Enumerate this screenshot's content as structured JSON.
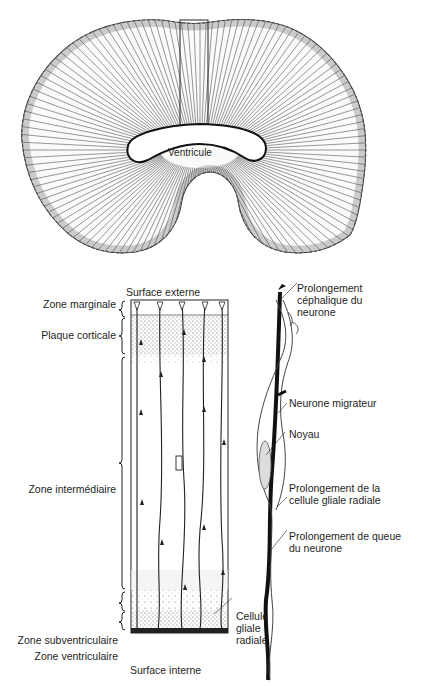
{
  "figure": {
    "top_panel": {
      "name": "coronal-section-brain",
      "labels": {
        "ventricle": "Ventricule"
      }
    },
    "left_panel": {
      "name": "cortical-column",
      "surface_top": "Surface externe",
      "surface_bottom": "Surface interne",
      "zones": [
        {
          "id": "marginal",
          "label": "Zone marginale"
        },
        {
          "id": "cortical_plate",
          "label": "Plaque corticale"
        },
        {
          "id": "intermediate",
          "label": "Zone intermédiaire"
        },
        {
          "id": "subventricular",
          "label": "Zone subventriculaire"
        },
        {
          "id": "ventricular",
          "label": "Zone ventriculaire"
        }
      ],
      "radial_glia_label": "Cellule gliale radiale"
    },
    "right_panel": {
      "name": "migrating-neuron-detail",
      "labels": [
        {
          "id": "leading_process",
          "text": "Prolongement céphalique du neurone"
        },
        {
          "id": "migrating_neuron",
          "text": "Neurone migrateur"
        },
        {
          "id": "nucleus",
          "text": "Noyau"
        },
        {
          "id": "glial_process",
          "text": "Prolongement de la cellule gliale radiale"
        },
        {
          "id": "trailing_process",
          "text": "Prolongement de queue du neurone"
        }
      ]
    }
  }
}
